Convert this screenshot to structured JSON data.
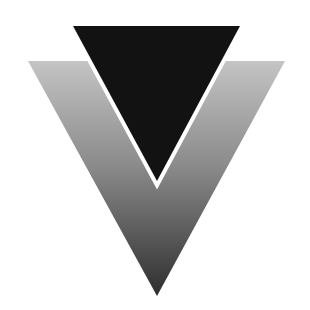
{
  "logo": {
    "name": "inverted-triangles-logo",
    "canvas": {
      "width": 310,
      "height": 310,
      "background": "#ffffff"
    },
    "gray_triangle": {
      "points": "28,61 285,61 157,296",
      "gradient_top": "#c4c4c4",
      "gradient_mid": "#8a8a8a",
      "gradient_bottom": "#2e2e2e"
    },
    "dark_triangle": {
      "points": "73,26 240,26 157,181",
      "fill": "#121212",
      "outline": "#ffffff",
      "outline_width": 4
    }
  }
}
